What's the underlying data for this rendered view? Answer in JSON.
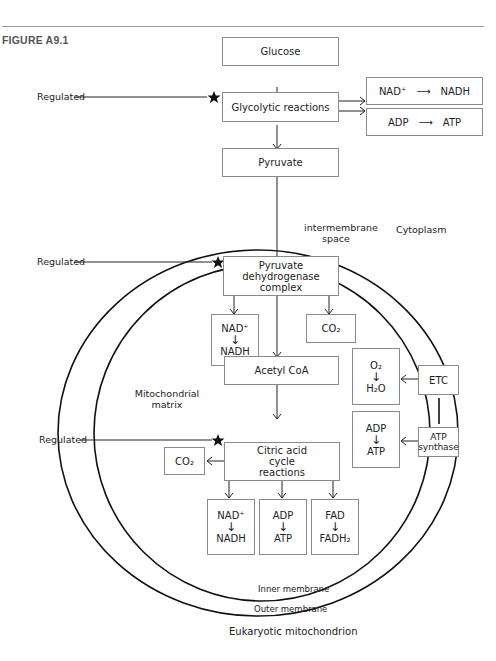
{
  "figure_label": "FIGURE A9.1",
  "caption": "Eukaryotic mitochondrion",
  "regions": {
    "cytoplasm": "Cytoplasm",
    "intermembrane_1": "intermembrane",
    "intermembrane_2": "space",
    "matrix_1": "Mitochondrial",
    "matrix_2": "matrix",
    "inner_membrane": "Inner membrane",
    "outer_membrane": "Outer membrane"
  },
  "regulated_label": "Regulated",
  "boxes": {
    "glucose": "Glucose",
    "glycolytic": "Glycolytic reactions",
    "nad_nadh_glyco": {
      "from": "NAD⁺",
      "to": "NADH"
    },
    "adp_atp_glyco": {
      "from": "ADP",
      "to": "ATP"
    },
    "pyruvate": "Pyruvate",
    "pdh_1": "Pyruvate",
    "pdh_2": "dehydrogenase",
    "pdh_3": "complex",
    "pdh_nad": {
      "from": "NAD⁺",
      "to": "NADH"
    },
    "pdh_co2": "CO₂",
    "acetyl_coa": "Acetyl CoA",
    "o2_h2o": {
      "from": "O₂",
      "to": "H₂O"
    },
    "etc": "ETC",
    "adp_atp_synth": {
      "from": "ADP",
      "to": "ATP"
    },
    "atp_synthase_1": "ATP",
    "atp_synthase_2": "synthase",
    "citric_1": "Citric acid",
    "citric_2": "cycle",
    "citric_3": "reactions",
    "citric_co2": "CO₂",
    "citric_nad": {
      "from": "NAD⁺",
      "to": "NADH"
    },
    "citric_adp": {
      "from": "ADP",
      "to": "ATP"
    },
    "citric_fad": {
      "from": "FAD",
      "to": "FADH₂"
    }
  },
  "arrow_glyph": "↓",
  "colors": {
    "line": "#1a1a1a",
    "box_border": "#8a8a8a",
    "star": "#111111"
  }
}
